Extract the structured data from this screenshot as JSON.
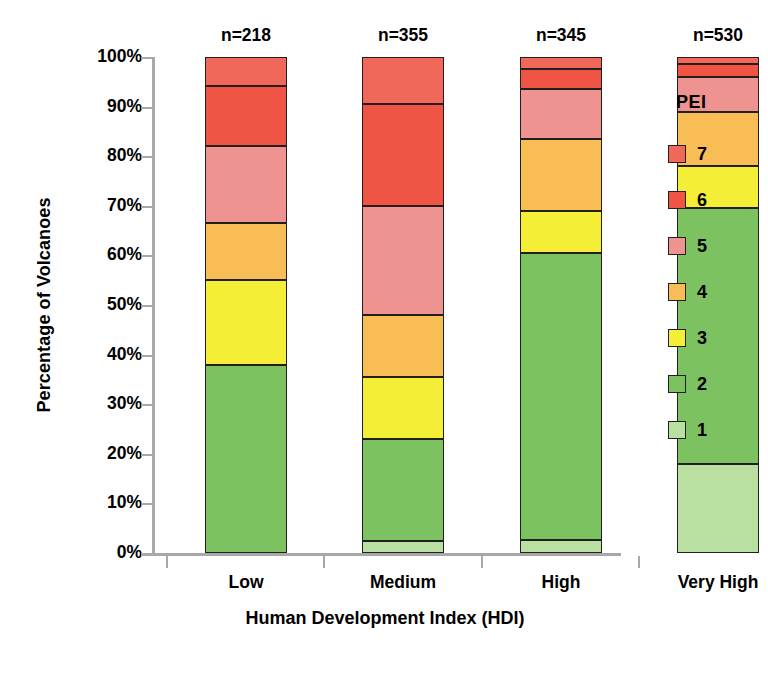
{
  "chart_data": {
    "type": "bar",
    "subtype": "stacked-percentage",
    "title": "",
    "xlabel": "Human Development Index (HDI)",
    "ylabel": "Percentage of Volcanoes",
    "categories": [
      "Low",
      "Medium",
      "High",
      "Very High"
    ],
    "category_counts": [
      "n=218",
      "n=355",
      "n=345",
      "n=530"
    ],
    "ylim": [
      0,
      100
    ],
    "ytick_labels": [
      "0%",
      "10%",
      "20%",
      "30%",
      "40%",
      "50%",
      "60%",
      "70%",
      "80%",
      "90%",
      "100%"
    ],
    "ytick_values": [
      0,
      10,
      20,
      30,
      40,
      50,
      60,
      70,
      80,
      90,
      100
    ],
    "grid": false,
    "legend_title": "PEI",
    "legend_position": "right",
    "legend_order": [
      "7",
      "6",
      "5",
      "4",
      "3",
      "2",
      "1"
    ],
    "series": [
      {
        "name": "1",
        "color": "#b9e0a0",
        "values": [
          0.0,
          2.4,
          2.7,
          18.0
        ]
      },
      {
        "name": "2",
        "color": "#7dc261",
        "values": [
          38.0,
          20.6,
          57.8,
          51.5
        ]
      },
      {
        "name": "3",
        "color": "#f4ee37",
        "values": [
          17.0,
          12.4,
          8.5,
          8.5
        ]
      },
      {
        "name": "4",
        "color": "#f8bd55",
        "values": [
          11.5,
          12.6,
          14.5,
          11.0
        ]
      },
      {
        "name": "5",
        "color": "#ef9391",
        "values": [
          15.5,
          22.0,
          10.0,
          7.0
        ]
      },
      {
        "name": "6",
        "color": "#ef5444",
        "values": [
          12.2,
          20.5,
          4.0,
          2.5
        ]
      },
      {
        "name": "7",
        "color": "#f0685a",
        "values": [
          5.8,
          9.5,
          2.5,
          1.5
        ]
      }
    ],
    "cumulative_tops": {
      "Low": {
        "1": 0.0,
        "2": 38.0,
        "3": 55.0,
        "4": 66.5,
        "5": 82.0,
        "6": 94.2,
        "7": 100.0
      },
      "Medium": {
        "1": 2.4,
        "2": 23.0,
        "3": 35.4,
        "4": 48.0,
        "5": 70.0,
        "6": 90.5,
        "7": 100.0
      },
      "High": {
        "1": 2.7,
        "2": 60.5,
        "3": 69.0,
        "4": 83.5,
        "5": 93.5,
        "6": 97.5,
        "7": 100.0
      },
      "Very High": {
        "1": 18.0,
        "2": 69.5,
        "3": 78.0,
        "4": 89.0,
        "5": 96.0,
        "6": 98.5,
        "7": 100.0
      }
    }
  },
  "axis": {
    "tick_color": "#a8a8a8",
    "outline_color": "#231f20"
  }
}
